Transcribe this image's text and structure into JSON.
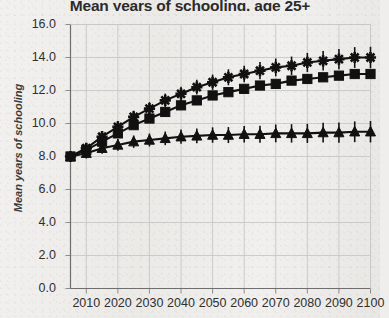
{
  "chart_data": {
    "type": "line",
    "title": "Mean years of schooling, age 25+",
    "xlabel": "",
    "ylabel": "Mean years of schooling",
    "xlim": [
      2005,
      2100
    ],
    "ylim": [
      0.0,
      16.0
    ],
    "grid": true,
    "legend": "none",
    "y_ticks": [
      "16.0",
      "14.0",
      "12.0",
      "10.0",
      "8.0",
      "6.0",
      "4.0",
      "2.0",
      "0.0"
    ],
    "y_tick_values": [
      16.0,
      14.0,
      12.0,
      10.0,
      8.0,
      6.0,
      4.0,
      2.0,
      0.0
    ],
    "x_ticks": [
      "2010",
      "2020",
      "2030",
      "2040",
      "2050",
      "2060",
      "2070",
      "2080",
      "2090",
      "2100"
    ],
    "x_tick_values": [
      2010,
      2020,
      2030,
      2040,
      2050,
      2060,
      2070,
      2080,
      2090,
      2100
    ],
    "x": [
      2005,
      2010,
      2015,
      2020,
      2025,
      2030,
      2035,
      2040,
      2045,
      2050,
      2055,
      2060,
      2065,
      2070,
      2075,
      2080,
      2085,
      2090,
      2095,
      2100
    ],
    "series": [
      {
        "name": "star-series",
        "marker": "star",
        "error_bars": true,
        "values": [
          8.0,
          8.5,
          9.2,
          9.8,
          10.4,
          10.9,
          11.4,
          11.8,
          12.2,
          12.5,
          12.8,
          13.0,
          13.2,
          13.4,
          13.5,
          13.7,
          13.8,
          13.9,
          14.0,
          14.0
        ]
      },
      {
        "name": "square-series",
        "marker": "square",
        "error_bars": false,
        "values": [
          8.0,
          8.4,
          8.9,
          9.4,
          9.9,
          10.3,
          10.7,
          11.1,
          11.4,
          11.7,
          11.9,
          12.1,
          12.3,
          12.4,
          12.6,
          12.7,
          12.8,
          12.9,
          13.0,
          13.0
        ]
      },
      {
        "name": "triangle-series",
        "marker": "triangle",
        "error_bars": true,
        "values": [
          8.0,
          8.2,
          8.5,
          8.7,
          8.9,
          9.0,
          9.1,
          9.2,
          9.25,
          9.3,
          9.3,
          9.35,
          9.35,
          9.4,
          9.4,
          9.4,
          9.45,
          9.45,
          9.5,
          9.5
        ]
      }
    ]
  },
  "colors": {
    "ink": "#111111",
    "grid": "#c7c7c7",
    "axis": "#6e6e6e",
    "paper": "#efeeec"
  }
}
